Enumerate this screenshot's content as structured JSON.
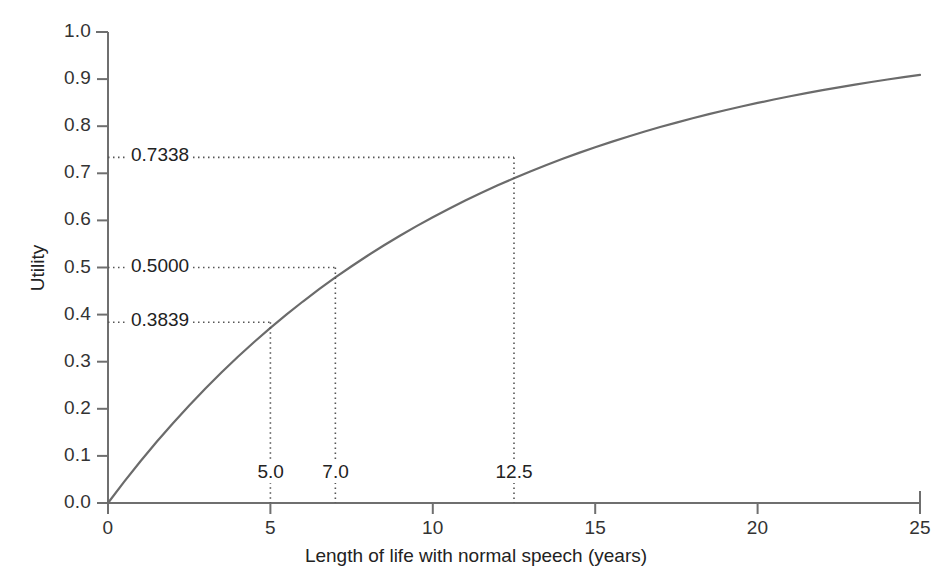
{
  "chart_data": {
    "type": "line",
    "title": "",
    "xlabel": "Length of life with normal speech (years)",
    "ylabel": "Utility",
    "xlim": [
      0,
      25
    ],
    "ylim": [
      0.0,
      1.0
    ],
    "grid": false,
    "legend": "none",
    "x_ticks": [
      "0",
      "5",
      "10",
      "15",
      "20",
      "25"
    ],
    "x_tick_values": [
      0,
      5,
      10,
      15,
      20,
      25
    ],
    "y_ticks": [
      "0.0",
      "0.1",
      "0.2",
      "0.3",
      "0.4",
      "0.5",
      "0.6",
      "0.7",
      "0.8",
      "0.9",
      "1.0"
    ],
    "y_tick_values": [
      0.0,
      0.1,
      0.2,
      0.3,
      0.4,
      0.5,
      0.6,
      0.7,
      0.8,
      0.9,
      1.0
    ],
    "series": [
      {
        "name": "Utility curve",
        "color": "#6b6b6b",
        "x": [
          0,
          0.5,
          1,
          1.5,
          2,
          2.5,
          3,
          3.5,
          4,
          4.5,
          5,
          5.5,
          6,
          6.5,
          7,
          7.5,
          8,
          8.5,
          9,
          9.5,
          10,
          10.5,
          11,
          11.5,
          12,
          12.5,
          13,
          13.5,
          14,
          14.5,
          15,
          15.5,
          16,
          16.5,
          17,
          17.5,
          18,
          18.5,
          19,
          19.5,
          20,
          20.5,
          21,
          21.5,
          22,
          22.5,
          23,
          23.5,
          24,
          24.5,
          25
        ],
        "y": [
          0.0,
          0.0453,
          0.0886,
          0.1299,
          0.1694,
          0.2071,
          0.2431,
          0.2775,
          0.3104,
          0.3418,
          0.3718,
          0.4004,
          0.4278,
          0.4539,
          0.4789,
          0.5027,
          0.5255,
          0.5472,
          0.568,
          0.5878,
          0.6068,
          0.6249,
          0.6422,
          0.6587,
          0.6745,
          0.6895,
          0.7039,
          0.7177,
          0.7308,
          0.7434,
          0.7554,
          0.7668,
          0.7777,
          0.7882,
          0.7982,
          0.8077,
          0.8168,
          0.8255,
          0.8338,
          0.8418,
          0.8494,
          0.8566,
          0.8635,
          0.8701,
          0.8765,
          0.8825,
          0.8883,
          0.8938,
          0.8991,
          0.9041,
          0.9089
        ]
      }
    ],
    "annotations": [
      {
        "x": 5.0,
        "y": 0.3839,
        "x_label": "5.0",
        "y_label": "0.3839"
      },
      {
        "x": 7.0,
        "y": 0.5,
        "x_label": "7.0",
        "y_label": "0.5000"
      },
      {
        "x": 12.5,
        "y": 0.7338,
        "x_label": "12.5",
        "y_label": "0.7338"
      }
    ],
    "colors": {
      "curve": "#6b6b6b",
      "axis": "#6f6f6f",
      "annotation_line": "#555555",
      "text": "#2b2b2b"
    }
  }
}
